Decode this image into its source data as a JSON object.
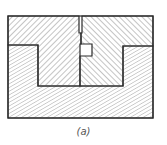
{
  "figure": {
    "caption": "(a)",
    "line_color": "#2a2a2a",
    "hatch_color": "#8a8a8a",
    "parts": [
      {
        "name": "upper-left-block",
        "hatch": "forward"
      },
      {
        "name": "upper-right-block",
        "hatch": "backward"
      },
      {
        "name": "base-block",
        "hatch": "forward-fine"
      }
    ]
  }
}
